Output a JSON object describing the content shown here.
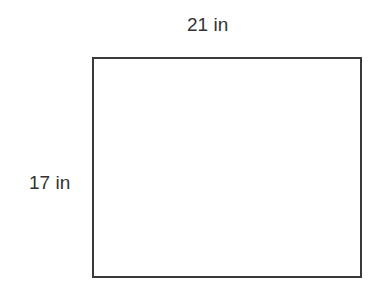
{
  "diagram": {
    "shape": "rectangle",
    "width_label": "21 in",
    "height_label": "17 in",
    "stroke_color": "#3a3a3a",
    "text_color": "#333333"
  }
}
